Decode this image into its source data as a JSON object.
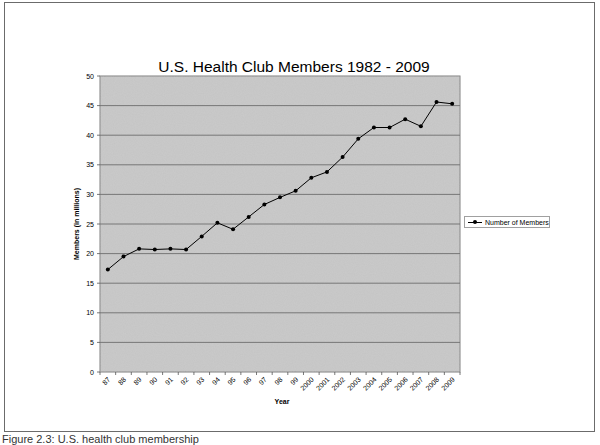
{
  "chart_data": {
    "type": "line",
    "title": "U.S. Health Club Members 1982 - 2009",
    "xlabel": "Year",
    "ylabel": "Members (in millions)",
    "categories": [
      "87",
      "88",
      "89",
      "90",
      "91",
      "92",
      "93",
      "94",
      "95",
      "96",
      "97",
      "98",
      "99",
      "2000",
      "2001",
      "2002",
      "2003",
      "2004",
      "2005",
      "2006",
      "2007",
      "2008",
      "2009"
    ],
    "series": [
      {
        "name": "Number of Members",
        "values": [
          17.3,
          19.5,
          20.8,
          20.7,
          20.8,
          20.7,
          22.9,
          25.2,
          24.1,
          26.2,
          28.3,
          29.5,
          30.6,
          32.8,
          33.8,
          36.3,
          39.4,
          41.3,
          41.3,
          42.7,
          41.5,
          45.6,
          45.3
        ]
      }
    ],
    "ylim": [
      0,
      50
    ],
    "yticks": [
      0,
      5,
      10,
      15,
      20,
      25,
      30,
      35,
      40,
      45,
      50
    ],
    "grid": true,
    "legend_position": "right",
    "plot_background": "#c8c8c8",
    "line_color": "#000000"
  },
  "caption": "Figure 2.3: U.S. health club membership"
}
